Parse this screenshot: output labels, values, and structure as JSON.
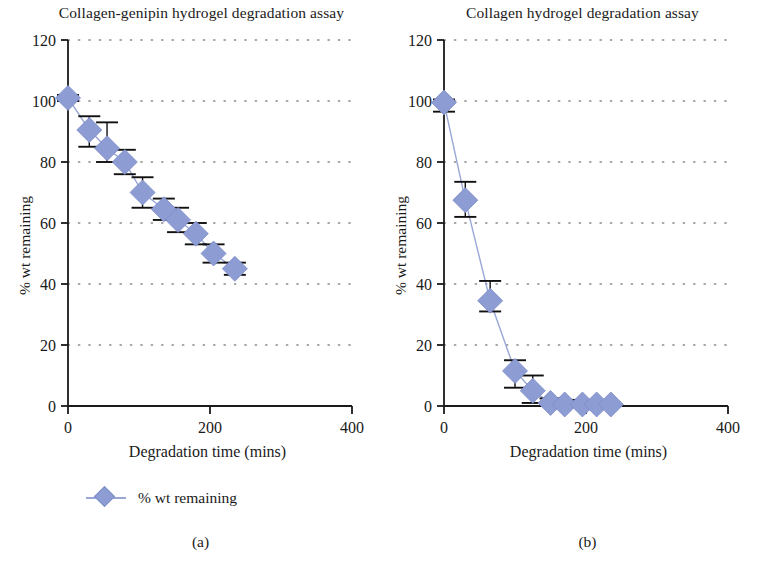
{
  "figure": {
    "marker_color": "#8d9cd3",
    "line_color": "#9aa7d6",
    "axis_color": "#1a1a1a",
    "grid_color": "#8a8a8a"
  },
  "panels": [
    {
      "key": "a",
      "subplot_label": "(a)",
      "title": "Collagen-genipin hydrogel degradation assay",
      "xlabel": "Degradation time (mins)",
      "ylabel": "% wt remaining",
      "legend_label": "% wt remaining",
      "xticks": [
        "0",
        "200",
        "400"
      ],
      "yticks": [
        "0",
        "20",
        "40",
        "60",
        "80",
        "100",
        "120"
      ]
    },
    {
      "key": "b",
      "subplot_label": "(b)",
      "title": "Collagen hydrogel degradation assay",
      "xlabel": "Degradation time (mins)",
      "ylabel": "% wt remaining",
      "legend_label": "% wt remaining",
      "xticks": [
        "0",
        "200",
        "400"
      ],
      "yticks": [
        "0",
        "20",
        "40",
        "60",
        "80",
        "100",
        "120"
      ]
    }
  ],
  "chart_data": [
    {
      "type": "scatter",
      "panel": "a",
      "title": "Collagen-genipin hydrogel degradation assay",
      "xlabel": "Degradation time (mins)",
      "ylabel": "% wt remaining",
      "xlim": [
        0,
        400
      ],
      "ylim": [
        0,
        120
      ],
      "xticks": [
        0,
        200,
        400
      ],
      "yticks": [
        0,
        20,
        40,
        60,
        80,
        100,
        120
      ],
      "grid": "horizontal-dotted",
      "legend": [
        "% wt remaining"
      ],
      "legend_position": "below-axis-left",
      "series": [
        {
          "name": "% wt remaining",
          "x": [
            0,
            30,
            55,
            80,
            105,
            135,
            155,
            180,
            205,
            235
          ],
          "values": [
            101,
            90.5,
            84.5,
            80,
            70,
            64.5,
            61,
            56.5,
            50,
            45
          ],
          "yerr_lower": [
            1,
            5.5,
            4.5,
            4,
            5,
            3.5,
            4,
            3.5,
            3,
            2
          ],
          "yerr_upper": [
            1,
            4.5,
            8.5,
            4,
            5,
            3.5,
            4,
            3.5,
            3,
            2
          ]
        }
      ]
    },
    {
      "type": "scatter",
      "panel": "b",
      "title": "Collagen hydrogel degradation assay",
      "xlabel": "Degradation time (mins)",
      "ylabel": "% wt remaining",
      "xlim": [
        0,
        400
      ],
      "ylim": [
        0,
        120
      ],
      "xticks": [
        0,
        200,
        400
      ],
      "yticks": [
        0,
        20,
        40,
        60,
        80,
        100,
        120
      ],
      "grid": "horizontal-dotted",
      "legend": [
        "% wt remaining"
      ],
      "legend_position": "below-axis-left",
      "series": [
        {
          "name": "% wt remaining",
          "x": [
            0,
            30,
            65,
            100,
            125,
            150,
            170,
            195,
            215,
            235
          ],
          "values": [
            99.5,
            67.5,
            34.5,
            11.5,
            5,
            1,
            0.5,
            0.5,
            0.5,
            0.5
          ],
          "yerr_lower": [
            3,
            5.5,
            3.5,
            5.5,
            4,
            1,
            0,
            0,
            0,
            0
          ],
          "yerr_upper": [
            1,
            6,
            6.5,
            3.5,
            5,
            1.5,
            1.5,
            1.5,
            0,
            0
          ]
        }
      ]
    }
  ]
}
